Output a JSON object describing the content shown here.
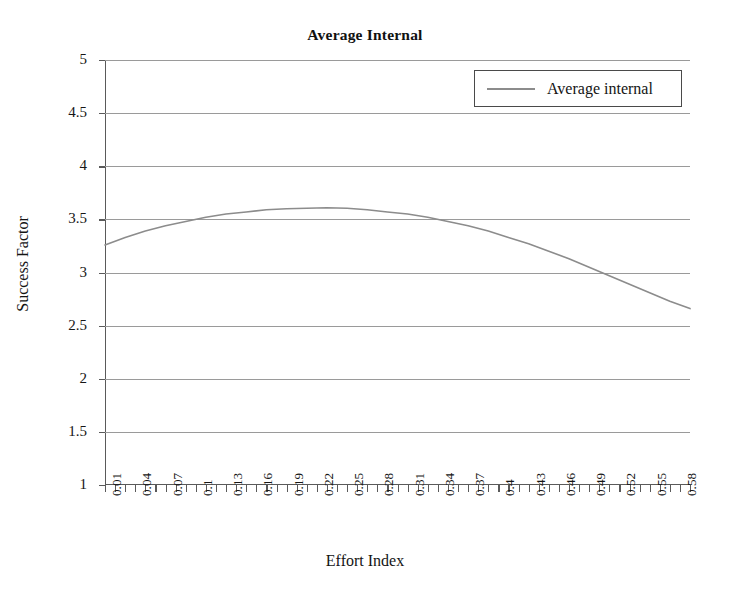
{
  "chart_data": {
    "type": "line",
    "title": "Average Internal",
    "xlabel": "Effort Index",
    "ylabel": "Success Factor",
    "grid": true,
    "legend_position": "top-right",
    "xlim": [
      0.01,
      0.59
    ],
    "ylim": [
      1,
      5
    ],
    "ytick_labels": [
      "5",
      "4.5",
      "4",
      "3.5",
      "3",
      "2.5",
      "2",
      "1.5",
      "1"
    ],
    "ytick_values": [
      5,
      4.5,
      4,
      3.5,
      3,
      2.5,
      2,
      1.5,
      1
    ],
    "xtick_labels": [
      "0.01",
      "0.04",
      "0.07",
      "0.1",
      "0.13",
      "0.16",
      "0.19",
      "0.22",
      "0.25",
      "0.28",
      "0.31",
      "0.34",
      "0.37",
      "0.4",
      "0.43",
      "0.46",
      "0.49",
      "0.52",
      "0.55",
      "0.58"
    ],
    "xtick_values": [
      0.01,
      0.04,
      0.07,
      0.1,
      0.13,
      0.16,
      0.19,
      0.22,
      0.25,
      0.28,
      0.31,
      0.34,
      0.37,
      0.4,
      0.43,
      0.46,
      0.49,
      0.52,
      0.55,
      0.58
    ],
    "minor_tick_count": 59,
    "series": [
      {
        "name": "Average internal",
        "color": "#8c8c8c",
        "x": [
          0.01,
          0.03,
          0.05,
          0.07,
          0.09,
          0.11,
          0.13,
          0.15,
          0.17,
          0.19,
          0.21,
          0.23,
          0.25,
          0.27,
          0.29,
          0.31,
          0.33,
          0.35,
          0.37,
          0.39,
          0.41,
          0.43,
          0.45,
          0.47,
          0.49,
          0.51,
          0.53,
          0.55,
          0.57,
          0.59
        ],
        "y": [
          3.26,
          3.33,
          3.39,
          3.44,
          3.48,
          3.52,
          3.55,
          3.57,
          3.59,
          3.6,
          3.605,
          3.61,
          3.605,
          3.59,
          3.57,
          3.55,
          3.52,
          3.48,
          3.44,
          3.39,
          3.33,
          3.27,
          3.2,
          3.13,
          3.05,
          2.97,
          2.89,
          2.81,
          2.73,
          2.66
        ]
      }
    ]
  },
  "legend": {
    "entries": [
      {
        "label": "Average internal",
        "color": "#8c8c8c",
        "marker": "line-swatch"
      }
    ]
  }
}
